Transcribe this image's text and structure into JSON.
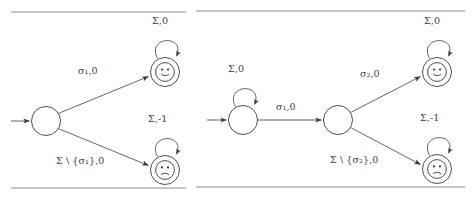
{
  "figure": {
    "caption_rules": [
      {
        "name": "left-top-rule",
        "x1": 11,
        "y1": 12,
        "x2": 186,
        "y2": 12
      },
      {
        "name": "left-bottom-rule",
        "x1": 11,
        "y1": 188,
        "x2": 186,
        "y2": 188
      },
      {
        "name": "right-top-rule",
        "x1": 196,
        "y1": 11,
        "x2": 465,
        "y2": 11
      },
      {
        "name": "right-bottom-rule",
        "x1": 196,
        "y1": 187,
        "x2": 465,
        "y2": 187
      }
    ],
    "panels": [
      {
        "id": "left-automaton",
        "name": "left-automaton-panel",
        "states": [
          {
            "id": "q0",
            "name": "initial-state",
            "cx": 46,
            "cy": 121,
            "r": 14.5,
            "accepting": false,
            "face": "none"
          },
          {
            "id": "q-accept-happy",
            "name": "accepting-state-happy",
            "cx": 165,
            "cy": 72,
            "r": 14.5,
            "accepting": true,
            "face": "smile"
          },
          {
            "id": "q-accept-sad",
            "name": "accepting-state-sad",
            "cx": 165,
            "cy": 170,
            "r": 14.5,
            "accepting": true,
            "face": "frown"
          }
        ],
        "start_arrow": {
          "name": "start-arrow",
          "x1": 11,
          "y1": 121,
          "x2": 31,
          "y2": 121
        },
        "transitions": [
          {
            "name": "transition-sigma1",
            "from": "q0",
            "to": "q-accept-happy",
            "label_text": "σ₁,0",
            "label_x": 79,
            "label_y": 69
          },
          {
            "name": "transition-sigma-complement",
            "from": "q0",
            "to": "q-accept-sad",
            "label_text": "Σ \\ {σ₁},0",
            "label_x": 58,
            "label_y": 159
          }
        ],
        "self_loops": [
          {
            "name": "self-loop-happy",
            "state": "q-accept-happy",
            "label_text": "Σ,0",
            "label_x": 152,
            "label_y": 17
          },
          {
            "name": "self-loop-sad",
            "state": "q-accept-sad",
            "label_text": "Σ,-1",
            "label_x": 149,
            "label_y": 115
          }
        ]
      },
      {
        "id": "right-automaton",
        "name": "right-automaton-panel",
        "states": [
          {
            "id": "r0",
            "name": "initial-state",
            "cx": 243,
            "cy": 120,
            "r": 14.5,
            "accepting": false,
            "face": "none"
          },
          {
            "id": "r1",
            "name": "intermediate-state",
            "cx": 338,
            "cy": 120,
            "r": 14.5,
            "accepting": false,
            "face": "none"
          },
          {
            "id": "r-accept-happy",
            "name": "accepting-state-happy",
            "cx": 437,
            "cy": 72,
            "r": 14.5,
            "accepting": true,
            "face": "smile"
          },
          {
            "id": "r-accept-sad",
            "name": "accepting-state-sad",
            "cx": 437,
            "cy": 169,
            "r": 14.5,
            "accepting": true,
            "face": "frown"
          }
        ],
        "start_arrow": {
          "name": "start-arrow",
          "x1": 207,
          "y1": 120,
          "x2": 228,
          "y2": 120
        },
        "transitions": [
          {
            "name": "transition-sigma1",
            "from": "r0",
            "to": "r1",
            "label_text": "σ₁,0",
            "label_x": 277,
            "label_y": 104
          },
          {
            "name": "transition-sigma2",
            "from": "r1",
            "to": "r-accept-happy",
            "label_text": "σ₂,0",
            "label_x": 361,
            "label_y": 72
          },
          {
            "name": "transition-sigma2-complement",
            "from": "r1",
            "to": "r-accept-sad",
            "label_text": "Σ \\ {σ₂},0",
            "label_x": 332,
            "label_y": 158
          }
        ],
        "self_loops": [
          {
            "name": "self-loop-initial",
            "state": "r0",
            "label_text": "Σ,0",
            "label_x": 229,
            "label_y": 66
          },
          {
            "name": "self-loop-happy",
            "state": "r-accept-happy",
            "label_text": "Σ,0",
            "label_x": 424,
            "label_y": 16
          },
          {
            "name": "self-loop-sad",
            "state": "r-accept-sad",
            "label_text": "Σ,-1",
            "label_x": 421,
            "label_y": 114
          }
        ]
      }
    ],
    "colors": {
      "stroke": "#3a3a3a",
      "edge": "#4a4a4a",
      "rule": "#8c8c8c",
      "background": "#ffffff",
      "text": "#3d3d3d"
    }
  }
}
